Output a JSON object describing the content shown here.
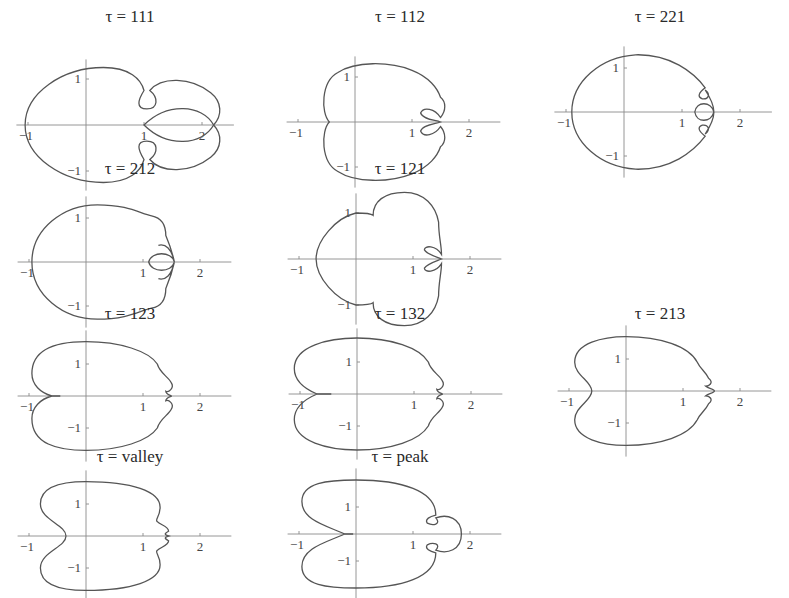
{
  "figure": {
    "symbol": "τ",
    "panels": [
      {
        "id": "p111",
        "label": "111",
        "title": "τ = 111",
        "left": 0,
        "top": 8,
        "ox": 86,
        "oy": 103,
        "sx": 58,
        "sy": 46,
        "ticks": {
          "x": [
            "-1",
            "1",
            "2"
          ],
          "y": [
            "1",
            "-1"
          ]
        },
        "path": "M -1.05 0 C -1.05 0.7 -0.4 1.25 0.3 1.25 C 0.75 1.25 0.95 1.0 1.0 0.75 C 0.9 0.55 0.85 0.35 1.05 0.35 C 1.25 0.35 1.25 0.6 1.1 0.75 C 1.3 1.05 1.8 1.05 2.15 0.7 C 2.35 0.5 2.35 0.2 2.2 0 C 2.0 0.45 1.4 0.5 1.0 0 C 1.4 -0.5 2.0 -0.45 2.2 0 C 2.35 -0.2 2.35 -0.5 2.15 -0.7 C 1.8 -1.05 1.3 -1.05 1.1 -0.75 C 1.25 -0.6 1.25 -0.35 1.05 -0.35 C 0.85 -0.35 0.9 -0.55 1.0 -0.75 C 0.95 -1.0 0.75 -1.25 0.3 -1.25 C -0.4 -1.25 -1.05 -0.7 -1.05 0 Z"
      },
      {
        "id": "p112",
        "label": "112",
        "title": "τ = 112",
        "left": 270,
        "top": 8,
        "ox": 85,
        "oy": 100,
        "sx": 57,
        "sy": 45,
        "ticks": {
          "x": [
            "-1",
            "1",
            "2"
          ],
          "y": [
            "1",
            "-1"
          ]
        },
        "path": "M -0.45 0 C -0.6 0.2 -0.6 0.9 -0.3 1.1 C 0 1.35 0.6 1.35 1.0 1.15 C 1.3 1.0 1.45 0.75 1.5 0.55 C 1.6 0.45 1.6 0.25 1.5 0.1 C 1.4 0.3 1.2 0.35 1.15 0.2 C 1.2 0.05 1.4 0.05 1.5 0 C 1.4 -0.05 1.2 -0.05 1.15 -0.2 C 1.2 -0.35 1.4 -0.3 1.5 -0.1 C 1.6 -0.25 1.6 -0.45 1.5 -0.55 C 1.45 -0.75 1.3 -1.0 1.0 -1.15 C 0.6 -1.35 0 -1.35 -0.3 -1.1 C -0.6 -0.9 -0.6 -0.2 -0.45 0 Z"
      },
      {
        "id": "p221",
        "label": "221",
        "title": "τ = 221",
        "left": 530,
        "top": 8,
        "ox": 94,
        "oy": 90,
        "sx": 58,
        "sy": 44,
        "ticks": {
          "x": [
            "-1",
            "1",
            "2"
          ],
          "y": [
            "1",
            "-1"
          ]
        },
        "path": "M -0.9 0 C -0.9 0.7 -0.4 1.25 0.2 1.3 C 0.8 1.32 1.2 0.9 1.4 0.55 C 1.3 0.45 1.25 0.35 1.35 0.3 C 1.45 0.28 1.5 0.4 1.4 0.5 C 1.5 0.3 1.55 0.15 1.55 0 C 1.5 0.25 1.25 0.25 1.22 0 C 1.25 -0.25 1.5 -0.25 1.55 0 C 1.55 -0.15 1.5 -0.3 1.4 -0.5 C 1.5 -0.4 1.45 -0.28 1.35 -0.3 C 1.25 -0.35 1.3 -0.45 1.4 -0.55 C 1.2 -0.9 0.8 -1.32 0.2 -1.3 C -0.4 -1.25 -0.9 -0.7 -0.9 0 Z"
      },
      {
        "id": "p212",
        "label": "212",
        "title": "τ = 212",
        "left": 0,
        "top": 160,
        "ox": 86,
        "oy": 88,
        "sx": 57,
        "sy": 44,
        "ticks": {
          "x": [
            "-1",
            "1",
            "2"
          ],
          "y": [
            "1",
            "-1"
          ]
        },
        "path": "M -0.95 0 C -0.95 0.75 -0.4 1.3 0.2 1.3 C 0.75 1.3 0.95 1.1 1.15 1.05 C 1.35 1.0 1.4 0.8 1.4 0.6 C 1.45 0.45 1.5 0.3 1.55 0 C 1.5 0.25 1.15 0.25 1.1 0 C 1.15 -0.25 1.5 -0.25 1.55 0 C 1.5 -0.3 1.45 -0.45 1.4 -0.6 C 1.4 -0.8 1.35 -1.0 1.15 -1.05 C 0.95 -1.1 0.75 -1.3 0.2 -1.3 C -0.4 -1.3 -0.95 -0.75 -0.95 0 Z M 1.27 0.38 C 1.4 0.42 1.5 0.3 1.55 0 M 1.27 -0.38 C 1.4 -0.42 1.5 -0.3 1.55 0"
      },
      {
        "id": "p121",
        "label": "121",
        "title": "τ = 121",
        "left": 270,
        "top": 160,
        "ox": 86,
        "oy": 85,
        "sx": 57,
        "sy": 46,
        "ticks": {
          "x": [
            "-1",
            "1",
            "2"
          ],
          "y": [
            "1",
            "-1"
          ]
        },
        "path": "M -0.7 0 C -0.7 0.4 -0.35 0.9 0 1.0 C 0.15 1.0 0.25 1.0 0.3 0.95 C 0.3 1.25 0.5 1.45 0.85 1.45 C 1.2 1.45 1.4 1.15 1.45 0.8 C 1.45 0.5 1.5 0.3 1.5 0.1 C 1.4 0.3 1.2 0.3 1.2 0.2 C 1.25 0.1 1.4 0.05 1.5 0 C 1.4 -0.05 1.25 -0.1 1.2 -0.2 C 1.2 -0.3 1.4 -0.3 1.5 -0.1 C 1.5 -0.3 1.45 -0.5 1.45 -0.8 C 1.4 -1.15 1.2 -1.45 0.85 -1.45 C 0.5 -1.45 0.3 -1.25 0.3 -0.95 C 0.25 -1.0 0.15 -1.0 0 -1.0 C -0.35 -0.9 -0.7 -0.4 -0.7 0 Z"
      },
      {
        "id": "p123",
        "label": "123",
        "title": "τ = 123",
        "left": 0,
        "top": 305,
        "ox": 86,
        "oy": 77,
        "sx": 57,
        "sy": 32,
        "ticks": {
          "x": [
            "-1",
            "1",
            "2"
          ],
          "y": [
            "1",
            "-1"
          ]
        },
        "path": "M -0.6 0 C -0.8 0.1 -0.95 0.35 -0.95 0.7 C -0.95 1.5 -0.5 1.7 0 1.7 C 0.6 1.7 1.1 1.4 1.25 1.0 C 1.3 0.7 1.45 0.6 1.5 0.4 C 1.55 0.25 1.45 0.1 1.4 0.15 C 1.4 0.05 1.5 0.02 1.5 0 C 1.5 -0.02 1.4 -0.05 1.4 -0.15 C 1.45 -0.1 1.55 -0.25 1.5 -0.4 C 1.45 -0.6 1.3 -0.7 1.25 -1.0 C 1.1 -1.4 0.6 -1.7 0 -1.7 C -0.5 -1.7 -0.95 -1.5 -0.95 -0.7 C -0.95 -0.35 -0.8 -0.1 -0.6 0 L -0.45 0"
      },
      {
        "id": "p132",
        "label": "132",
        "title": "τ = 132",
        "left": 270,
        "top": 305,
        "ox": 87,
        "oy": 75,
        "sx": 57,
        "sy": 32,
        "ticks": {
          "x": [
            "-1",
            "1",
            "2"
          ],
          "y": [
            "1",
            "-1"
          ]
        },
        "path": "M -0.7 0 C -0.9 0.15 -1.1 0.4 -1.1 0.8 C -1.1 1.5 -0.5 1.75 0 1.75 C 0.6 1.75 1.1 1.45 1.25 1.0 C 1.3 0.7 1.45 0.6 1.5 0.4 C 1.55 0.25 1.45 0.1 1.4 0.15 C 1.4 0.05 1.5 0.02 1.5 0 C 1.5 -0.02 1.4 -0.05 1.4 -0.15 C 1.45 -0.1 1.55 -0.25 1.5 -0.4 C 1.45 -0.6 1.3 -0.7 1.25 -1.0 C 1.1 -1.45 0.6 -1.75 0 -1.75 C -0.5 -1.75 -1.1 -1.5 -1.1 -0.8 C -1.1 -0.4 -0.9 -0.15 -0.7 0 L -0.45 0"
      },
      {
        "id": "p213",
        "label": "213",
        "title": "τ = 213",
        "left": 530,
        "top": 305,
        "ox": 96,
        "oy": 72,
        "sx": 57,
        "sy": 32,
        "ticks": {
          "x": [
            "-1",
            "1",
            "2"
          ],
          "y": [
            "1",
            "-1"
          ]
        },
        "path": "M -0.6 0 C -0.6 0.3 -0.9 0.5 -0.9 0.9 C -0.9 1.5 -0.4 1.7 0 1.7 C 0.6 1.7 1.1 1.4 1.25 0.9 C 1.3 0.7 1.4 0.6 1.45 0.4 C 1.55 0.25 1.45 0.15 1.4 0.15 C 1.45 0.08 1.55 0.05 1.55 0 C 1.55 -0.05 1.45 -0.08 1.4 -0.15 C 1.45 -0.15 1.55 -0.25 1.45 -0.4 C 1.4 -0.6 1.3 -0.7 1.25 -0.9 C 1.1 -1.4 0.6 -1.7 0 -1.7 C -0.4 -1.7 -0.9 -1.5 -0.9 -0.9 C -0.9 -0.5 -0.6 -0.3 -0.6 0 Z"
      },
      {
        "id": "pvalley",
        "label": "valley",
        "title": "τ = valley",
        "left": 0,
        "top": 448,
        "ox": 86,
        "oy": 74,
        "sx": 57,
        "sy": 32,
        "ticks": {
          "x": [
            "-1",
            "1",
            "2"
          ],
          "y": [
            "1",
            "-1"
          ]
        },
        "path": "M -0.35 0 C -0.35 0.35 -0.8 0.5 -0.8 1.0 C -0.8 1.6 -0.35 1.7 0 1.7 C 0.8 1.7 1.3 1.4 1.3 0.9 C 1.3 0.6 1.2 0.5 1.25 0.45 C 1.3 0.35 1.45 0.3 1.45 0.15 C 1.4 0.1 1.35 0.05 1.45 0 C 1.35 -0.05 1.4 -0.1 1.45 -0.15 C 1.45 -0.3 1.3 -0.35 1.25 -0.45 C 1.2 -0.5 1.3 -0.6 1.3 -0.9 C 1.3 -1.4 0.8 -1.7 0 -1.7 C -0.35 -1.7 -0.8 -1.6 -0.8 -1.0 C -0.8 -0.5 -0.35 -0.35 -0.35 0 Z"
      },
      {
        "id": "ppeak",
        "label": "peak",
        "title": "τ = peak",
        "left": 270,
        "top": 448,
        "ox": 86,
        "oy": 72,
        "sx": 57,
        "sy": 27,
        "ticks": {
          "x": [
            "-1",
            "1",
            "2"
          ],
          "y": [
            "1",
            "-1"
          ]
        },
        "path": "M -0.2 0 C -0.5 0.3 -0.95 0.5 -0.95 1.2 C -0.95 1.9 -0.5 2.0 0 2.0 C 0.8 2.0 1.4 1.6 1.4 0.7 C 1.3 0.65 1.2 0.55 1.25 0.4 C 1.35 0.3 1.5 0.35 1.4 0.6 C 1.6 0.75 1.85 0.6 1.85 0 C 1.85 -0.6 1.6 -0.75 1.4 -0.6 C 1.5 -0.35 1.35 -0.3 1.25 -0.4 C 1.2 -0.55 1.3 -0.65 1.4 -0.7 C 1.4 -1.6 0.8 -2.0 0 -2.0 C -0.5 -2.0 -0.95 -1.9 -0.95 -1.2 C -0.95 -0.5 -0.5 -0.3 -0.2 0 L -0.05 0"
      }
    ]
  },
  "chart_data": {
    "type": "line",
    "title": "",
    "grid_layout": "4 rows × 3 columns (parametric closed curves on axes)",
    "xlabel": "",
    "ylabel": "",
    "xlim": [
      -1.1,
      2.5
    ],
    "ylim": [
      -1.5,
      1.5
    ],
    "x_ticks": [
      "-1",
      "1",
      "2"
    ],
    "y_ticks": [
      "1",
      "-1"
    ],
    "grid": false,
    "legend": null,
    "series": [
      {
        "name": "τ = 111",
        "row": 1,
        "col": 1,
        "x_range": [
          -1.05,
          2.3
        ],
        "y_range": [
          -1.25,
          1.25
        ],
        "features": "two outer lobes crossing at x≈2.2, inner lobe from x=1 to 2.2, small loops at (1.05, ±0.5)"
      },
      {
        "name": "τ = 112",
        "row": 1,
        "col": 2,
        "x_range": [
          -0.6,
          1.6
        ],
        "y_range": [
          -1.35,
          1.35
        ],
        "features": "indent at x≈-0.45; two small loops near x≈1.2–1.5"
      },
      {
        "name": "τ = 221",
        "row": 1,
        "col": 3,
        "x_range": [
          -0.9,
          1.55
        ],
        "y_range": [
          -1.3,
          1.3
        ],
        "features": "central loop on x-axis near x≈1.2–1.55, two small loops at y≈±0.35"
      },
      {
        "name": "τ = 212",
        "row": 2,
        "col": 1,
        "x_range": [
          -0.95,
          1.55
        ],
        "y_range": [
          -1.3,
          1.3
        ],
        "features": "central loop x≈1.1–1.55 with two tiny loops at y≈±0.38"
      },
      {
        "name": "τ = 121",
        "row": 2,
        "col": 2,
        "x_range": [
          -0.7,
          1.5
        ],
        "y_range": [
          -1.45,
          1.45
        ],
        "features": "notches at (0.3, ±0.95); two small loops near x≈1.2–1.5"
      },
      {
        "name": "τ = 123",
        "row": 3,
        "col": 1,
        "x_range": [
          -0.95,
          1.55
        ],
        "y_range": [
          -1.7,
          1.7
        ],
        "features": "cusp at x≈-0.6; tiny loops near x≈1.4"
      },
      {
        "name": "τ = 132",
        "row": 3,
        "col": 2,
        "x_range": [
          -1.1,
          1.55
        ],
        "y_range": [
          -1.75,
          1.75
        ],
        "features": "cusp at x≈-0.7; tiny loops near x≈1.4"
      },
      {
        "name": "τ = 213",
        "row": 3,
        "col": 3,
        "x_range": [
          -0.9,
          1.55
        ],
        "y_range": [
          -1.7,
          1.7
        ],
        "features": "rounded indent at x≈-0.6; small bumps near x≈1.4–1.55"
      },
      {
        "name": "τ = valley",
        "row": 4,
        "col": 1,
        "x_range": [
          -0.8,
          1.45
        ],
        "y_range": [
          -1.7,
          1.7
        ],
        "features": "deep indent at x≈-0.35; small cusp near x≈1.45"
      },
      {
        "name": "τ = peak",
        "row": 4,
        "col": 2,
        "x_range": [
          -0.95,
          1.85
        ],
        "y_range": [
          -2.0,
          2.0
        ],
        "features": "cusp at x≈-0.2; outer lobe extending to x≈1.85, two small loops near x≈1.3"
      }
    ]
  }
}
